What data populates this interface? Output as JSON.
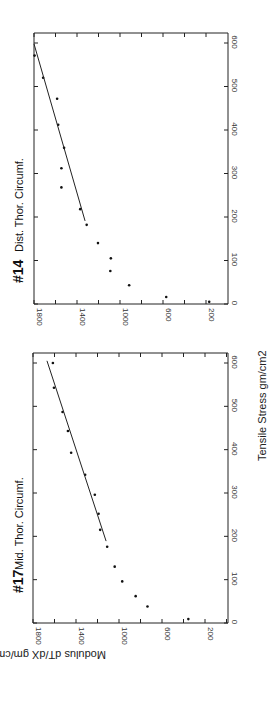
{
  "figure": {
    "shared_xlabel": "Tensile Stress gm/cm2",
    "shared_ylabel": "Modulus dT/dX gm/cm2",
    "orientation": "rotated 90° clockwise (stress axis vertical on right side, modulus axis along bottom, reversed)"
  },
  "panels": [
    {
      "id": "panel-14",
      "title_number": "#14",
      "title_text": "Dist. Thor. Circumf.",
      "stress_ticks": [
        "0",
        "100",
        "200",
        "300",
        "400",
        "500",
        "600"
      ],
      "modulus_ticks": [
        "1800",
        "1400",
        "1000",
        "600",
        "200"
      ]
    },
    {
      "id": "panel-17",
      "title_number": "#17",
      "title_text": "Mid. Thor. Circumf.",
      "stress_ticks": [
        "0",
        "100",
        "200",
        "300",
        "400",
        "500",
        "600"
      ],
      "modulus_ticks": [
        "1800",
        "1400",
        "1000",
        "600",
        "200"
      ]
    }
  ],
  "chart_data": [
    {
      "type": "scatter",
      "title": "#14 Dist. Thor. Circumf.",
      "xlabel": "Tensile Stress gm/cm2",
      "ylabel": "Modulus dT/dX gm/cm2",
      "xlim": [
        0,
        600
      ],
      "ylim": [
        0,
        1800
      ],
      "x_ticks": [
        0,
        100,
        200,
        300,
        400,
        500,
        600
      ],
      "y_ticks": [
        200,
        600,
        1000,
        1400,
        1800
      ],
      "grid": false,
      "series": [
        {
          "name": "measured",
          "x": [
            5,
            16,
            43,
            76,
            105,
            140,
            182,
            218,
            268,
            312,
            359,
            412,
            472,
            520,
            571
          ],
          "y": [
            170,
            570,
            915,
            1090,
            1085,
            1205,
            1310,
            1370,
            1545,
            1545,
            1520,
            1575,
            1585,
            1715,
            1795
          ]
        },
        {
          "name": "linear fit",
          "x": [
            191,
            598
          ],
          "y": [
            1325,
            1800
          ]
        }
      ]
    },
    {
      "type": "scatter",
      "title": "#17 Mid. Thor. Circumf.",
      "xlabel": "Tensile Stress gm/cm2",
      "ylabel": "Modulus dT/dX gm/cm2",
      "xlim": [
        0,
        600
      ],
      "ylim": [
        0,
        1800
      ],
      "x_ticks": [
        0,
        100,
        200,
        300,
        400,
        500,
        600
      ],
      "y_ticks": [
        200,
        600,
        1000,
        1400,
        1800
      ],
      "grid": false,
      "series": [
        {
          "name": "measured",
          "x": [
            9,
            38,
            62,
            96,
            130,
            176,
            215,
            252,
            296,
            342,
            393,
            443,
            487,
            543,
            600
          ],
          "y": [
            355,
            735,
            845,
            970,
            1040,
            1110,
            1175,
            1190,
            1225,
            1315,
            1445,
            1475,
            1525,
            1605,
            1615
          ]
        },
        {
          "name": "linear fit",
          "x": [
            189,
            605
          ],
          "y": [
            1120,
            1670
          ]
        }
      ]
    }
  ]
}
